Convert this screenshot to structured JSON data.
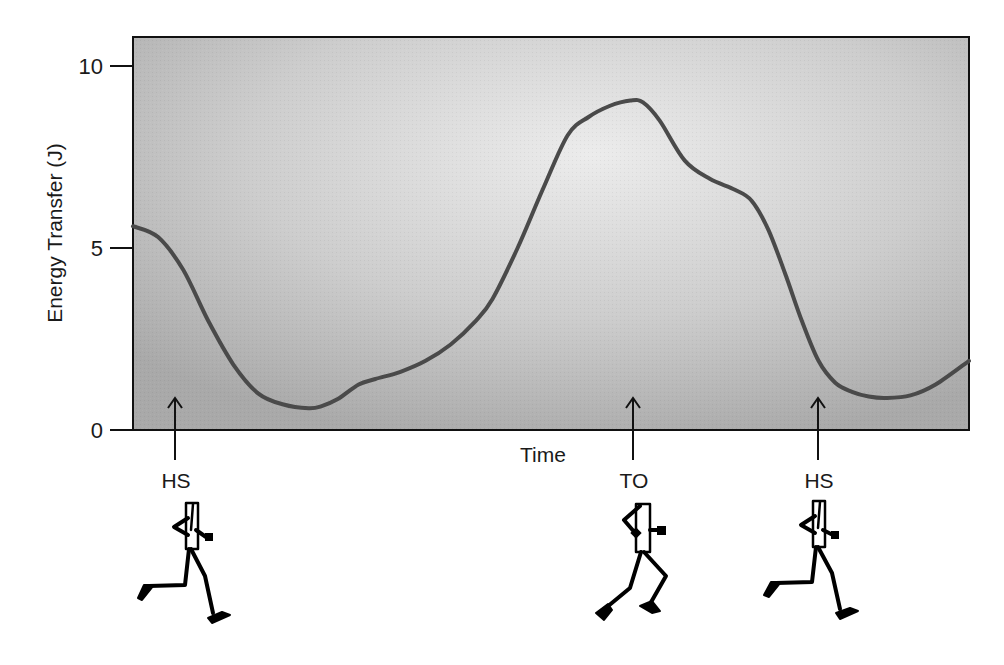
{
  "chart_data": {
    "type": "line",
    "title": "",
    "xlabel": "Time",
    "ylabel": "Energy Transfer (J)",
    "ylim": [
      0,
      10.8
    ],
    "xlim": [
      0,
      1
    ],
    "yticks": [
      0,
      5,
      10
    ],
    "ytick_labels": [
      "0",
      "5",
      "10"
    ],
    "xticks": [],
    "grid": false,
    "legend": null,
    "series": [
      {
        "name": "Energy Transfer",
        "color": "#4a4a4a",
        "x": [
          0.0,
          0.03,
          0.06,
          0.09,
          0.12,
          0.15,
          0.18,
          0.21,
          0.225,
          0.245,
          0.27,
          0.29,
          0.32,
          0.35,
          0.38,
          0.41,
          0.43,
          0.46,
          0.49,
          0.52,
          0.545,
          0.57,
          0.595,
          0.61,
          0.63,
          0.66,
          0.69,
          0.72,
          0.74,
          0.76,
          0.78,
          0.8,
          0.82,
          0.84,
          0.86,
          0.88,
          0.9,
          0.93,
          0.96,
          1.0
        ],
        "y": [
          5.6,
          5.3,
          4.4,
          3.0,
          1.8,
          1.0,
          0.7,
          0.6,
          0.65,
          0.85,
          1.25,
          1.4,
          1.6,
          1.9,
          2.35,
          3.0,
          3.6,
          5.0,
          6.6,
          8.1,
          8.6,
          8.9,
          9.05,
          9.0,
          8.5,
          7.4,
          6.9,
          6.6,
          6.3,
          5.5,
          4.3,
          3.0,
          1.9,
          1.3,
          1.05,
          0.92,
          0.88,
          0.95,
          1.25,
          1.9
        ]
      }
    ],
    "annotations": [
      {
        "label": "HS",
        "x": 0.05,
        "y": 0.8,
        "type": "up-arrow",
        "figure": "runner-heel-strike"
      },
      {
        "label": "TO",
        "x": 0.598,
        "y": 0.8,
        "type": "up-arrow",
        "figure": "runner-toe-off"
      },
      {
        "label": "HS",
        "x": 0.82,
        "y": 0.8,
        "type": "up-arrow",
        "figure": "runner-heel-strike"
      }
    ],
    "plot_background": "gray radial gradient, lighter at center"
  },
  "axes": {
    "y_title": "Energy Transfer (J)",
    "x_title": "Time",
    "y_ticks": [
      {
        "value": 0,
        "label": "0"
      },
      {
        "value": 5,
        "label": "5"
      },
      {
        "value": 10,
        "label": "10"
      }
    ]
  },
  "events": [
    {
      "label": "HS"
    },
    {
      "label": "TO"
    },
    {
      "label": "HS"
    }
  ],
  "colors": {
    "plot_bg_center": "#ececec",
    "plot_bg_edge": "#a9a9a9",
    "curve": "#4a4a4a",
    "axis": "#111111"
  }
}
